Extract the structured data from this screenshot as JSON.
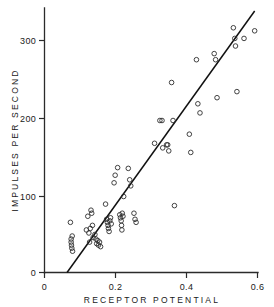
{
  "chart_data": {
    "type": "scatter",
    "title": "",
    "xlabel": "RECEPTOR POTENTIAL",
    "ylabel": "IMPULSES PER SECOND",
    "xlim": [
      0,
      0.6
    ],
    "ylim": [
      0,
      330
    ],
    "grid": false,
    "legend": null,
    "xticks": [
      0,
      0.2,
      0.4,
      0.6
    ],
    "xtick_labels": [
      "0",
      "0.2",
      "0.4",
      "0.6"
    ],
    "yticks": [
      0,
      100,
      200,
      300
    ],
    "ytick_labels": [
      "0",
      "100",
      "200",
      "300"
    ],
    "marker": "open-circle",
    "marker_color": "#2e2e2e",
    "points": [
      [
        0.073,
        66
      ],
      [
        0.075,
        44
      ],
      [
        0.075,
        40
      ],
      [
        0.076,
        36
      ],
      [
        0.077,
        32
      ],
      [
        0.078,
        48
      ],
      [
        0.079,
        28
      ],
      [
        0.118,
        56
      ],
      [
        0.122,
        74
      ],
      [
        0.125,
        52
      ],
      [
        0.127,
        40
      ],
      [
        0.129,
        58
      ],
      [
        0.131,
        82
      ],
      [
        0.133,
        78
      ],
      [
        0.135,
        62
      ],
      [
        0.137,
        46
      ],
      [
        0.142,
        50
      ],
      [
        0.145,
        44
      ],
      [
        0.147,
        38
      ],
      [
        0.15,
        42
      ],
      [
        0.152,
        36
      ],
      [
        0.155,
        40
      ],
      [
        0.158,
        34
      ],
      [
        0.172,
        90
      ],
      [
        0.175,
        70
      ],
      [
        0.177,
        66
      ],
      [
        0.179,
        62
      ],
      [
        0.18,
        58
      ],
      [
        0.182,
        54
      ],
      [
        0.184,
        68
      ],
      [
        0.186,
        72
      ],
      [
        0.188,
        64
      ],
      [
        0.196,
        118
      ],
      [
        0.199,
        128
      ],
      [
        0.206,
        138
      ],
      [
        0.212,
        76
      ],
      [
        0.214,
        72
      ],
      [
        0.216,
        68
      ],
      [
        0.217,
        62
      ],
      [
        0.218,
        56
      ],
      [
        0.219,
        78
      ],
      [
        0.221,
        74
      ],
      [
        0.223,
        100
      ],
      [
        0.236,
        137
      ],
      [
        0.24,
        122
      ],
      [
        0.243,
        114
      ],
      [
        0.252,
        78
      ],
      [
        0.255,
        70
      ],
      [
        0.258,
        66
      ],
      [
        0.31,
        170
      ],
      [
        0.325,
        200
      ],
      [
        0.331,
        200
      ],
      [
        0.333,
        164
      ],
      [
        0.344,
        168
      ],
      [
        0.347,
        168
      ],
      [
        0.35,
        160
      ],
      [
        0.358,
        250
      ],
      [
        0.362,
        200
      ],
      [
        0.366,
        88
      ],
      [
        0.408,
        182
      ],
      [
        0.412,
        158
      ],
      [
        0.428,
        280
      ],
      [
        0.432,
        222
      ],
      [
        0.438,
        210
      ],
      [
        0.478,
        288
      ],
      [
        0.482,
        280
      ],
      [
        0.486,
        230
      ],
      [
        0.532,
        322
      ],
      [
        0.536,
        308
      ],
      [
        0.538,
        298
      ],
      [
        0.542,
        238
      ],
      [
        0.562,
        308
      ],
      [
        0.592,
        318
      ]
    ],
    "fit_line": {
      "label": "regression line",
      "x_start": 0.0635,
      "y_start": 0,
      "x_end": 0.592,
      "y_end": 344
    }
  }
}
